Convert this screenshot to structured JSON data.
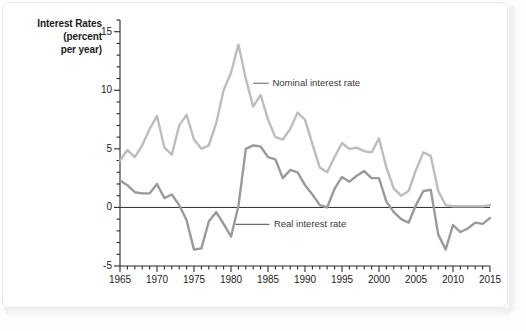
{
  "figure": {
    "background_color": "#ffffff",
    "panel_border_color": "#e9e9e9"
  },
  "axis_title": {
    "line1": "Interest Rates",
    "line2": "(percent",
    "line3": "per year)"
  },
  "annotations": {
    "nominal": "Nominal interest rate",
    "real": "Real interest rate"
  },
  "chart_data": {
    "type": "line",
    "title": "",
    "subtitle": "",
    "xlabel": "",
    "ylabel": "Interest Rates (percent per year)",
    "xlim": [
      1965,
      2015
    ],
    "ylim": [
      -5,
      16
    ],
    "grid": false,
    "legend_position": "inline-annotation",
    "zero_line": 0,
    "y_major_ticks": [
      -5,
      0,
      5,
      10,
      15
    ],
    "y_minor_tick_step": 1,
    "y_tick_labels": [
      "-5",
      "0",
      "5",
      "10",
      "15"
    ],
    "x_major_ticks": [
      1965,
      1970,
      1975,
      1980,
      1985,
      1990,
      1995,
      2000,
      2005,
      2010,
      2015
    ],
    "x_minor_tick_step": 1,
    "x_tick_labels": [
      "1965",
      "1970",
      "1975",
      "1980",
      "1985",
      "1990",
      "1995",
      "2000",
      "2005",
      "2010",
      "2015"
    ],
    "x": [
      1965,
      1966,
      1967,
      1968,
      1969,
      1970,
      1971,
      1972,
      1973,
      1974,
      1975,
      1976,
      1977,
      1978,
      1979,
      1980,
      1981,
      1982,
      1983,
      1984,
      1985,
      1986,
      1987,
      1988,
      1989,
      1990,
      1991,
      1992,
      1993,
      1994,
      1995,
      1996,
      1997,
      1998,
      1999,
      2000,
      2001,
      2002,
      2003,
      2004,
      2005,
      2006,
      2007,
      2008,
      2009,
      2010,
      2011,
      2012,
      2013,
      2014,
      2015
    ],
    "series": [
      {
        "name": "Nominal interest rate",
        "color": "#bdbdbd",
        "linewidth": 2.4,
        "values": [
          4.0,
          4.9,
          4.3,
          5.3,
          6.7,
          7.8,
          5.1,
          4.5,
          7.0,
          7.9,
          5.8,
          5.0,
          5.3,
          7.2,
          10.0,
          11.5,
          13.9,
          11.0,
          8.6,
          9.6,
          7.5,
          6.0,
          5.8,
          6.7,
          8.1,
          7.5,
          5.4,
          3.4,
          3.0,
          4.3,
          5.5,
          5.0,
          5.1,
          4.8,
          4.7,
          5.9,
          3.4,
          1.6,
          1.0,
          1.4,
          3.2,
          4.7,
          4.4,
          1.4,
          0.2,
          0.1,
          0.1,
          0.1,
          0.1,
          0.1,
          0.2
        ]
      },
      {
        "name": "Real interest rate",
        "color": "#9a9a9a",
        "linewidth": 2.4,
        "values": [
          2.3,
          1.9,
          1.3,
          1.2,
          1.2,
          2.0,
          0.8,
          1.1,
          0.2,
          -1.1,
          -3.6,
          -3.5,
          -1.2,
          -0.4,
          -1.4,
          -2.5,
          0.1,
          5.0,
          5.3,
          5.2,
          4.3,
          4.1,
          2.5,
          3.2,
          3.0,
          1.9,
          1.1,
          0.2,
          0.0,
          1.6,
          2.6,
          2.2,
          2.7,
          3.1,
          2.5,
          2.5,
          0.5,
          -0.4,
          -1.0,
          -1.3,
          0.2,
          1.4,
          1.5,
          -2.3,
          -3.6,
          -1.5,
          -2.1,
          -1.8,
          -1.3,
          -1.4,
          -0.9
        ]
      }
    ]
  }
}
